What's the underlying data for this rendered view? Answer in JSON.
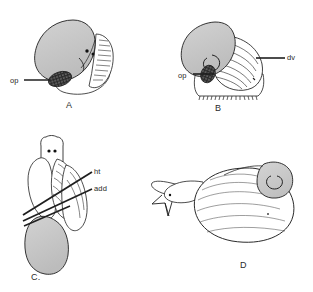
{
  "figure": {
    "background_color": "#ffffff",
    "ink_color": "#1f1f1f",
    "shell_fill_color": "#c8c8c8",
    "operculum_color": "#2a2a2a",
    "width": 313,
    "height": 292
  },
  "panels": [
    {
      "id": "A",
      "letter": "A",
      "description": "lateral view of larval gastropod with shell and operculum"
    },
    {
      "id": "B",
      "letter": "B",
      "description": "lateral view with velum and operculum"
    },
    {
      "id": "C",
      "letter": "C.",
      "description": "ventral view showing heart and adductor muscle"
    },
    {
      "id": "D",
      "letter": "D",
      "description": "lateral view of coiled juvenile with extended foot"
    }
  ],
  "annotations": [
    {
      "id": "op-a",
      "text": "op",
      "panel": "A",
      "meaning": "operculum"
    },
    {
      "id": "op-b",
      "text": "op",
      "panel": "B",
      "meaning": "operculum"
    },
    {
      "id": "dv-b",
      "text": "dv",
      "panel": "B",
      "meaning": "dorsal velum"
    },
    {
      "id": "ht-c",
      "text": "ht",
      "panel": "C",
      "meaning": "heart"
    },
    {
      "id": "add-c",
      "text": "add",
      "panel": "C",
      "meaning": "adductor muscle"
    }
  ]
}
